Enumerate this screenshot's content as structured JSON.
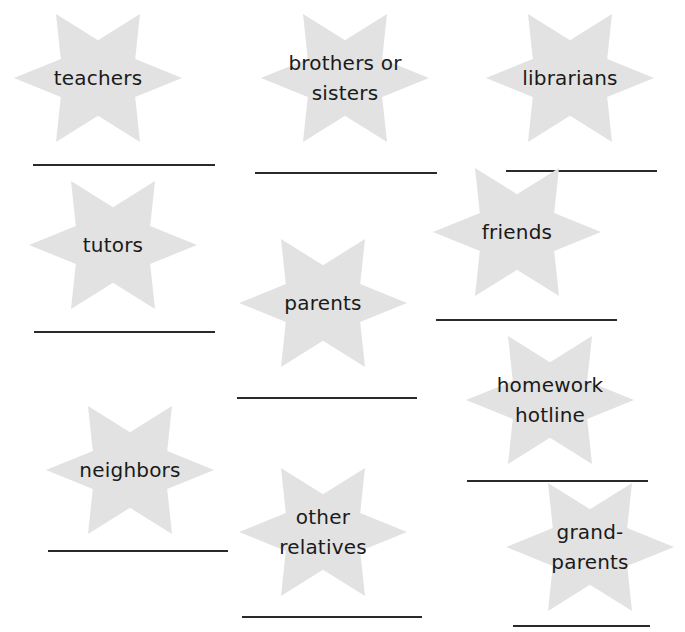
{
  "worksheet": {
    "star_color": "#e2e2e2",
    "line_color": "#2a2a2a",
    "text_color": "#1a1a1a",
    "items": [
      {
        "id": "teachers",
        "lines": [
          "teachers"
        ],
        "cx": 98,
        "cy": 78,
        "line": {
          "x1": 33,
          "x2": 215,
          "y": 165
        }
      },
      {
        "id": "brothers-or-sisters",
        "lines": [
          "brothers or",
          "sisters"
        ],
        "cx": 345,
        "cy": 78,
        "line": {
          "x1": 255,
          "x2": 437,
          "y": 173
        }
      },
      {
        "id": "librarians",
        "lines": [
          "librarians"
        ],
        "cx": 570,
        "cy": 78,
        "line": {
          "x1": 506,
          "x2": 657,
          "y": 171
        }
      },
      {
        "id": "tutors",
        "lines": [
          "tutors"
        ],
        "cx": 113,
        "cy": 245,
        "line": {
          "x1": 34,
          "x2": 215,
          "y": 332
        }
      },
      {
        "id": "parents",
        "lines": [
          "parents"
        ],
        "cx": 323,
        "cy": 303,
        "line": {
          "x1": 237,
          "x2": 417,
          "y": 398
        }
      },
      {
        "id": "friends",
        "lines": [
          "friends"
        ],
        "cx": 517,
        "cy": 232,
        "line": {
          "x1": 436,
          "x2": 617,
          "y": 320
        }
      },
      {
        "id": "homework-hotline",
        "lines": [
          "homework",
          "hotline"
        ],
        "cx": 550,
        "cy": 400,
        "line": {
          "x1": 467,
          "x2": 648,
          "y": 481
        }
      },
      {
        "id": "neighbors",
        "lines": [
          "neighbors"
        ],
        "cx": 130,
        "cy": 470,
        "line": {
          "x1": 48,
          "x2": 228,
          "y": 551
        }
      },
      {
        "id": "other-relatives",
        "lines": [
          "other",
          "relatives"
        ],
        "cx": 323,
        "cy": 532,
        "line": {
          "x1": 242,
          "x2": 422,
          "y": 617
        }
      },
      {
        "id": "grandparents",
        "lines": [
          "grand-",
          "parents"
        ],
        "cx": 590,
        "cy": 547,
        "line": {
          "x1": 513,
          "x2": 650,
          "y": 626
        }
      }
    ]
  }
}
